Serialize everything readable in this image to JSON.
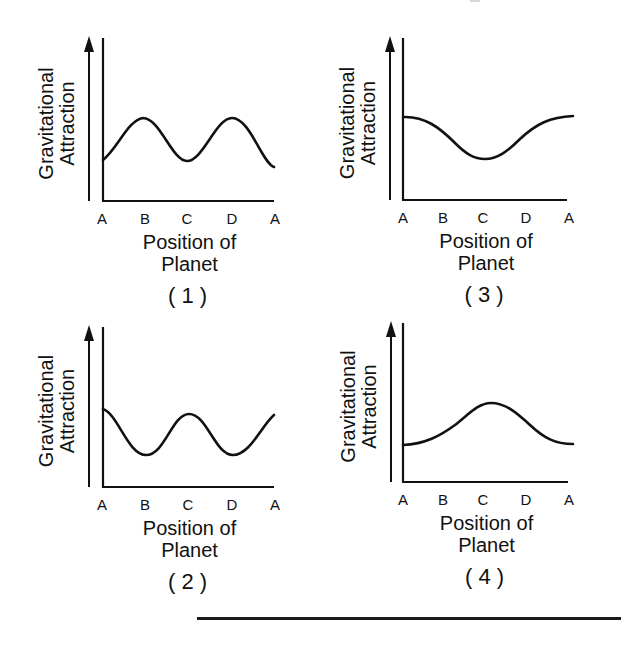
{
  "figure": {
    "panels_order_visual": [
      "1",
      "3",
      "2",
      "4"
    ],
    "bottom_rule": true
  },
  "chart_data": [
    {
      "id": "1",
      "caption": "( 1 )",
      "type": "line",
      "title": "",
      "xlabel_line1": "Position of",
      "xlabel_line2": "Planet",
      "ylabel_line1": "Gravitational",
      "ylabel_line2": "Attraction",
      "categories": [
        "A",
        "B",
        "C",
        "D",
        "A"
      ],
      "values": [
        0.35,
        0.6,
        0.35,
        0.6,
        0.3
      ],
      "description": "Two peaks at B and D, troughs at A and C",
      "grid": false,
      "legend": "none",
      "ylim": [
        0,
        1
      ],
      "path_px": "M103,160 C118,148 128,120 143,118 C160,118 172,161 187,161 C203,161 216,118 232,118 C250,118 262,163 274,167",
      "origin_px": [
        103,
        201
      ],
      "y_top_px": 38,
      "x_end_px": 274,
      "arrow_x_px": 89,
      "tick_x_px": [
        102,
        145,
        187,
        232,
        275
      ]
    },
    {
      "id": "3",
      "caption": "( 3 )",
      "type": "line",
      "title": "",
      "xlabel_line1": "Position of",
      "xlabel_line2": "Planet",
      "ylabel_line1": "Gravitational",
      "ylabel_line2": "Attraction",
      "categories": [
        "A",
        "B",
        "C",
        "D",
        "A"
      ],
      "values": [
        0.6,
        0.47,
        0.35,
        0.47,
        0.6
      ],
      "description": "Maximum at A, single minimum at C",
      "grid": false,
      "legend": "none",
      "ylim": [
        0,
        1
      ],
      "path_px": "M403,117 C425,116 440,128 455,143 C466,154 474,159 485,159 C497,159 507,152 520,139 C536,124 550,117 573,116",
      "origin_px": [
        403,
        200
      ],
      "y_top_px": 38,
      "x_end_px": 567,
      "arrow_x_px": 390,
      "tick_x_px": [
        403,
        443,
        483,
        526,
        569
      ]
    },
    {
      "id": "2",
      "caption": "( 2 )",
      "type": "line",
      "title": "",
      "xlabel_line1": "Position of",
      "xlabel_line2": "Planet",
      "ylabel_line1": "Gravitational",
      "ylabel_line2": "Attraction",
      "categories": [
        "A",
        "B",
        "C",
        "D",
        "A"
      ],
      "values": [
        0.5,
        0.2,
        0.47,
        0.2,
        0.47
      ],
      "description": "Peaks at A and C, troughs at B and D",
      "grid": false,
      "legend": "none",
      "ylim": [
        0,
        1
      ],
      "path_px": "M103,409 C118,414 128,455 146,455 C165,455 172,414 189,414 C207,414 215,455 233,455 C250,455 262,425 274,415",
      "origin_px": [
        103,
        487
      ],
      "y_top_px": 327,
      "x_end_px": 274,
      "arrow_x_px": 89,
      "tick_x_px": [
        102,
        145,
        188,
        232,
        275
      ]
    },
    {
      "id": "4",
      "caption": "( 4 )",
      "type": "line",
      "title": "",
      "xlabel_line1": "Position of",
      "xlabel_line2": "Planet",
      "ylabel_line1": "Gravitational",
      "ylabel_line2": "Attraction",
      "categories": [
        "A",
        "B",
        "C",
        "D",
        "A"
      ],
      "values": [
        0.25,
        0.35,
        0.5,
        0.35,
        0.25
      ],
      "description": "Minimum at A, single maximum at C",
      "grid": false,
      "legend": "none",
      "ylim": [
        0,
        1
      ],
      "path_px": "M403,445 C425,444 440,436 455,425 C468,415 478,403 491,403 C505,403 516,412 530,425 C544,438 555,444 573,444",
      "origin_px": [
        403,
        482
      ],
      "y_top_px": 323,
      "x_end_px": 568,
      "arrow_x_px": 391,
      "tick_x_px": [
        403,
        443,
        483,
        526,
        569
      ]
    }
  ]
}
